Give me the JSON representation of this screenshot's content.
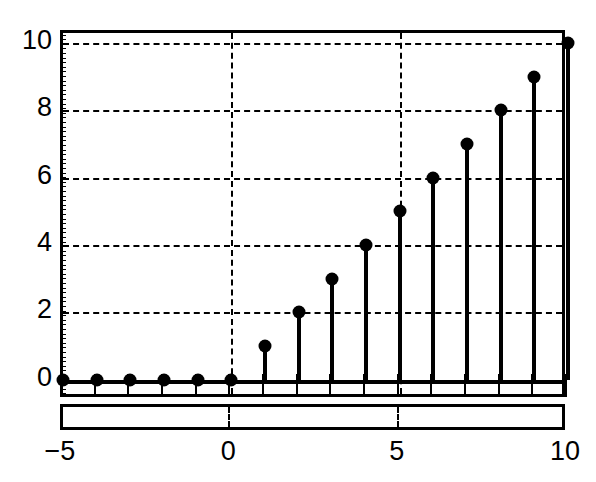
{
  "chart_data": {
    "type": "line",
    "plot_style": "stem",
    "title": "",
    "xlabel": "",
    "ylabel": "",
    "xlim": [
      -5,
      10
    ],
    "ylim": [
      -0.6,
      10.3
    ],
    "grid": true,
    "grid_style": "dashed",
    "legend": "none",
    "xticks": [
      -5,
      0,
      5,
      10
    ],
    "xtick_labels": [
      "−5",
      "0",
      "5",
      "10"
    ],
    "yticks": [
      0,
      2,
      4,
      6,
      8,
      10
    ],
    "ytick_labels": [
      "0",
      "2",
      "4",
      "6",
      "8",
      "10"
    ],
    "x": [
      -5,
      -4,
      -3,
      -2,
      -1,
      0,
      1,
      2,
      3,
      4,
      5,
      6,
      7,
      8,
      9,
      10
    ],
    "values": [
      0,
      0,
      0,
      0,
      0,
      0,
      1,
      2,
      3,
      4,
      5,
      6,
      7,
      8,
      9,
      10
    ],
    "series": [
      {
        "name": "ramp",
        "values": [
          0,
          0,
          0,
          0,
          0,
          0,
          1,
          2,
          3,
          4,
          5,
          6,
          7,
          8,
          9,
          10
        ]
      }
    ],
    "marker": "filled-circle",
    "marker_color": "#000000",
    "stem_color": "#000000",
    "baseline": 0,
    "annotations": []
  },
  "figure": {
    "background": "#ffffff",
    "axis_color": "#000000",
    "gridline_color": "#000000",
    "vertical_gridlines_at": [
      0,
      5
    ]
  }
}
